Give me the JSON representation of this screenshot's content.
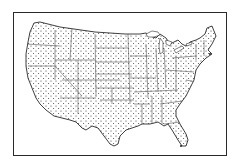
{
  "map": {
    "subject": "United States (contiguous) state outline map",
    "style": "stippled dot fill with state boundary lines",
    "colors": {
      "background": "#ffffff",
      "outline": "#2a2a2a",
      "stipple": "#333333",
      "state_lines": "#555555"
    },
    "frame": {
      "x": 13,
      "y": 12,
      "width": 214,
      "height": 144
    }
  }
}
